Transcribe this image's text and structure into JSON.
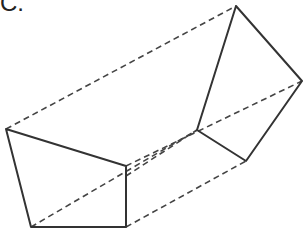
{
  "figure": {
    "label": "C.",
    "colors": {
      "solid": "#333333",
      "dashed": "#444444",
      "background": "#ffffff"
    },
    "vertices": {
      "front": [
        [
          6,
          129
        ],
        [
          126,
          166
        ],
        [
          126,
          227
        ],
        [
          31,
          227
        ]
      ],
      "back": [
        [
          236,
          6
        ],
        [
          302,
          81
        ],
        [
          246,
          161
        ],
        [
          197,
          130
        ]
      ]
    }
  }
}
